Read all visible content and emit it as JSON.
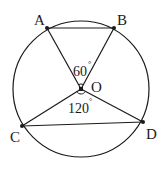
{
  "diagram": {
    "type": "circle-geometry",
    "circle": {
      "center": "O",
      "cx": 81,
      "cy": 89,
      "r": 68
    },
    "points": [
      {
        "name": "A",
        "x": 47,
        "y": 28,
        "label_x": 34,
        "label_y": 25
      },
      {
        "name": "B",
        "x": 114,
        "y": 28,
        "label_x": 117,
        "label_y": 25
      },
      {
        "name": "C",
        "x": 22,
        "y": 126,
        "label_x": 10,
        "label_y": 142
      },
      {
        "name": "D",
        "x": 143,
        "y": 122,
        "label_x": 146,
        "label_y": 139
      },
      {
        "name": "O",
        "x": 81,
        "y": 89,
        "label_x": 91,
        "label_y": 92
      }
    ],
    "segments": [
      "AB",
      "AO",
      "BO",
      "CO",
      "DO",
      "CD"
    ],
    "angles": [
      {
        "label": "60",
        "unit": "°",
        "between": "AOB",
        "x": 73,
        "y": 76
      },
      {
        "label": "120",
        "unit": "°",
        "between": "COD",
        "x": 68,
        "y": 113
      }
    ],
    "stroke_color": "#1a1a1a",
    "fill_color": "#ffffff"
  }
}
